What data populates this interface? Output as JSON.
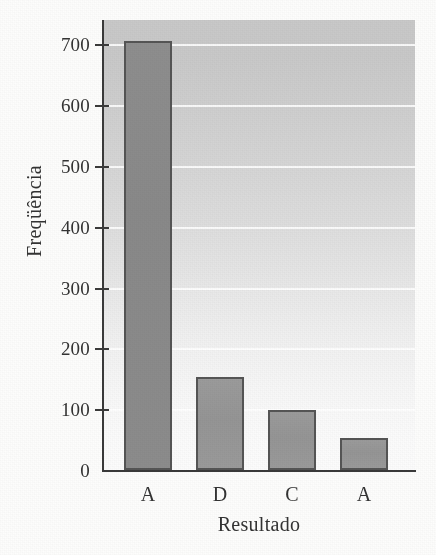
{
  "figure": {
    "background_color": "#fdfdfc",
    "plot_background_top": "#c9c9c9",
    "plot_background_bottom": "#fcfcfc",
    "bar_border_color": "#555555",
    "axis_color": "#3a3a3a",
    "gridline_color": "#ffffff"
  },
  "chart_data": {
    "type": "bar",
    "title": "",
    "xlabel": "Resultado",
    "ylabel": "Freqüência",
    "categories": [
      "A",
      "D",
      "C",
      "A"
    ],
    "values": [
      705,
      153,
      98,
      52
    ],
    "series": [
      {
        "name": "Freqüência",
        "values": [
          705,
          153,
          98,
          52
        ]
      }
    ],
    "ylim": [
      0,
      740
    ],
    "xlim": [
      0,
      4
    ],
    "yticks": [
      0,
      100,
      200,
      300,
      400,
      500,
      600,
      700
    ],
    "ytick_labels": [
      "0",
      "100",
      "200",
      "300",
      "400",
      "500",
      "600",
      "700"
    ],
    "xtick_labels": [
      "A",
      "D",
      "C",
      "A"
    ],
    "grid": "horizontal",
    "grid_color": "#ffffff",
    "legend": "none",
    "bar_colors": [
      "#8c8c8c",
      "#979797",
      "#979797",
      "#9a9a9a"
    ],
    "annotations": []
  }
}
